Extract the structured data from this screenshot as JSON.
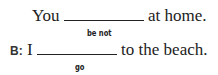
{
  "exercise": {
    "items": [
      {
        "speaker": "",
        "before": "You",
        "after": "at home.",
        "hint": "be not"
      },
      {
        "speaker": "B:",
        "before": "I",
        "after": "to the beach.",
        "hint": "go"
      }
    ]
  }
}
